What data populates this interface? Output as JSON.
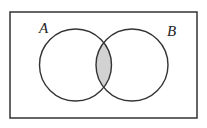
{
  "diagram": {
    "type": "venn",
    "set_a_label": "A",
    "set_b_label": "B",
    "colors": {
      "outline": "#333333",
      "intersection_fill": "#d2d2d2",
      "background": "#ffffff"
    }
  }
}
